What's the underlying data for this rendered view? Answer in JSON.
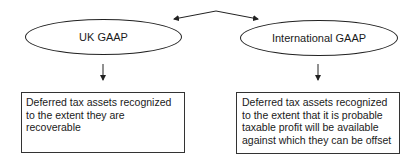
{
  "diagram": {
    "nodes": [
      {
        "id": "uk",
        "shape": "ellipse",
        "label": "UK GAAP"
      },
      {
        "id": "intl",
        "shape": "ellipse",
        "label": "International GAAP"
      },
      {
        "id": "uk_rule",
        "shape": "rectangle",
        "label": "Deferred tax assets recognized to the extent they are recoverable",
        "lines": [
          "Deferred tax assets recognized",
          "to the extent they are",
          "recoverable"
        ]
      },
      {
        "id": "intl_rule",
        "shape": "rectangle",
        "label": "Deferred tax assets recognized to the extent that it is probable taxable profit will be available against which they can be offset",
        "lines": [
          "Deferred tax assets recognized",
          "to the extent that it is probable",
          "taxable profit will be available",
          "against which they can be offset"
        ]
      }
    ],
    "edges": [
      {
        "from": "uk",
        "to": "intl",
        "type": "bidirectional-arrow"
      },
      {
        "from": "uk",
        "to": "uk_rule",
        "type": "arrow"
      },
      {
        "from": "intl",
        "to": "intl_rule",
        "type": "arrow"
      }
    ],
    "colors": {
      "stroke": "#222222",
      "text": "#1a1a1a",
      "background": "#ffffff"
    }
  }
}
